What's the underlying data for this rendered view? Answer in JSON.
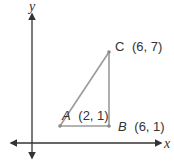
{
  "diagram": {
    "type": "coordinate-plane-triangle",
    "axes": {
      "x_label": "x",
      "y_label": "y",
      "color": "#333333"
    },
    "triangle": {
      "stroke_color": "#9a9a9a",
      "vertices": [
        {
          "name": "A",
          "coords": "(2, 1)",
          "x": 2,
          "y": 1
        },
        {
          "name": "B",
          "coords": "(6, 1)",
          "x": 6,
          "y": 1
        },
        {
          "name": "C",
          "coords": "(6, 7)",
          "x": 6,
          "y": 7
        }
      ]
    },
    "labels": {
      "A": "A",
      "A_coords": "(2, 1)",
      "B": "B",
      "B_coords": "(6, 1)",
      "C": "C",
      "C_coords": "(6, 7)"
    }
  }
}
